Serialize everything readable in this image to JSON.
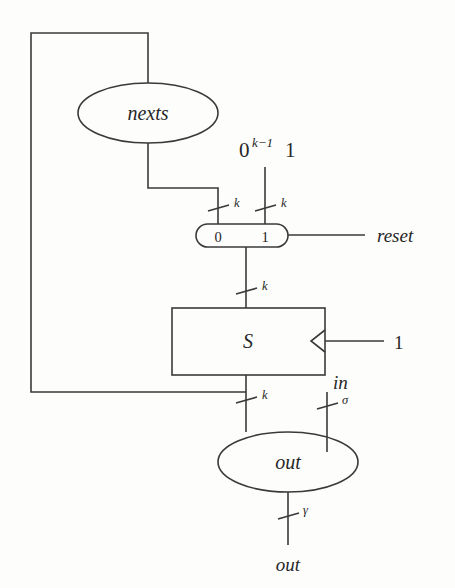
{
  "figure": {
    "kind": "circuit-diagram",
    "background_color": "#fdfdfc",
    "line_color": "#3a3a3a",
    "text_color": "#262626"
  },
  "nodes": {
    "nexts_ellipse": {
      "label": "nexts",
      "shape": "ellipse"
    },
    "out_ellipse": {
      "label": "out",
      "shape": "ellipse"
    },
    "state_box": {
      "label": "S",
      "shape": "rectangle"
    },
    "mux": {
      "shape": "stadium",
      "input_label_0": "0",
      "input_label_1": "1",
      "select_label": "reset"
    }
  },
  "constants": {
    "reset_value_base": "0",
    "reset_value_exponent": "k−1",
    "reset_value_suffix": "1",
    "clock_enable": "1"
  },
  "signals": {
    "input_in": "in",
    "output_out": "out"
  },
  "bus_widths": {
    "nexts_to_mux": "k",
    "const_to_mux": "k",
    "mux_to_state": "k",
    "state_to_out": "k"
  },
  "alphabets": {
    "input_symbol": "σ",
    "output_symbol": "γ"
  }
}
